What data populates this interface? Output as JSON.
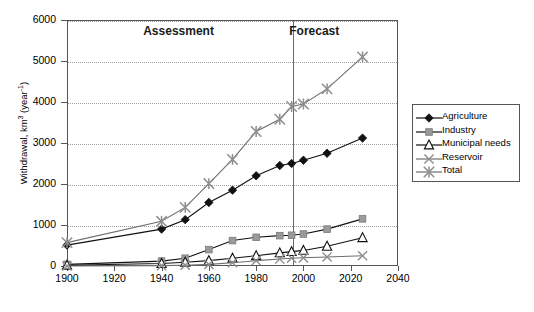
{
  "chart_data": {
    "type": "line",
    "title": "",
    "xlabel": "",
    "ylabel": "Withdrawal, km3 (year-1)",
    "ylabel_main": "Withdrawal, km",
    "ylabel_sup1": "3",
    "ylabel_mid": " (year",
    "ylabel_sup2": "-1",
    "ylabel_end": ")",
    "xlim": [
      1900,
      2040
    ],
    "ylim": [
      0,
      6000
    ],
    "xticks": [
      1900,
      1920,
      1940,
      1960,
      1980,
      2000,
      2020,
      2040
    ],
    "yticks": [
      0,
      1000,
      2000,
      3000,
      4000,
      5000,
      6000
    ],
    "xtick_labels": [
      "1900",
      "1920",
      "1940",
      "1960",
      "1980",
      "2000",
      "2020",
      "2040"
    ],
    "ytick_labels": [
      "0",
      "1000",
      "2000",
      "3000",
      "4000",
      "5000",
      "6000"
    ],
    "grid": true,
    "grid_style": "dotted-horizontal",
    "legend_position": "right-outside",
    "annotations": [
      {
        "text": "Assessment",
        "x": 1950,
        "y": 5700
      },
      {
        "text": "Forecast",
        "x": 2005,
        "y": 5700
      }
    ],
    "divider": {
      "x": 1995,
      "label": "assessment-forecast-divider"
    },
    "series": [
      {
        "name": "Agriculture",
        "marker": "filled-diamond",
        "color": "#111111",
        "x": [
          1900,
          1940,
          1950,
          1960,
          1970,
          1980,
          1990,
          1995,
          2000,
          2010,
          2025
        ],
        "values": [
          510,
          900,
          1130,
          1550,
          1850,
          2200,
          2450,
          2500,
          2580,
          2750,
          3120
        ]
      },
      {
        "name": "Industry",
        "marker": "filled-square",
        "color": "#9a9a9a",
        "x": [
          1900,
          1940,
          1950,
          1960,
          1970,
          1980,
          1990,
          1995,
          2000,
          2010,
          2025
        ],
        "values": [
          40,
          120,
          190,
          400,
          620,
          700,
          740,
          750,
          780,
          900,
          1150
        ]
      },
      {
        "name": "Municipal needs",
        "marker": "open-triangle",
        "color": "#111111",
        "x": [
          1900,
          1940,
          1950,
          1960,
          1970,
          1980,
          1990,
          1995,
          2000,
          2010,
          2025
        ],
        "values": [
          20,
          60,
          90,
          130,
          190,
          250,
          320,
          350,
          380,
          480,
          690
        ]
      },
      {
        "name": "Reservoir",
        "marker": "cross",
        "color": "#8e8e8e",
        "x": [
          1900,
          1940,
          1950,
          1960,
          1970,
          1980,
          1990,
          1995,
          2000,
          2010,
          2025
        ],
        "values": [
          0,
          10,
          20,
          40,
          80,
          130,
          170,
          190,
          200,
          220,
          250
        ]
      },
      {
        "name": "Total",
        "marker": "asterisk",
        "color": "#8e8e8e",
        "x": [
          1900,
          1940,
          1950,
          1960,
          1970,
          1980,
          1990,
          1995,
          2000,
          2010,
          2025
        ],
        "values": [
          570,
          1090,
          1430,
          2010,
          2600,
          3280,
          3580,
          3890,
          3950,
          4320,
          5100
        ]
      }
    ]
  },
  "legend": {
    "items": [
      {
        "label": "Agriculture",
        "marker": "filled-diamond",
        "color": "#111111"
      },
      {
        "label": "Industry",
        "marker": "filled-square",
        "color": "#9a9a9a"
      },
      {
        "label": "Municipal needs",
        "marker": "open-triangle",
        "color": "#111111"
      },
      {
        "label": "Reservoir",
        "marker": "cross",
        "color": "#8e8e8e"
      },
      {
        "label": "Total",
        "marker": "asterisk",
        "color": "#8e8e8e"
      }
    ]
  },
  "colors": {
    "axis": "#555555",
    "grid": "#9aa0a6",
    "divider": "#6b6b6b",
    "background": "#ffffff",
    "text": "#000000"
  }
}
